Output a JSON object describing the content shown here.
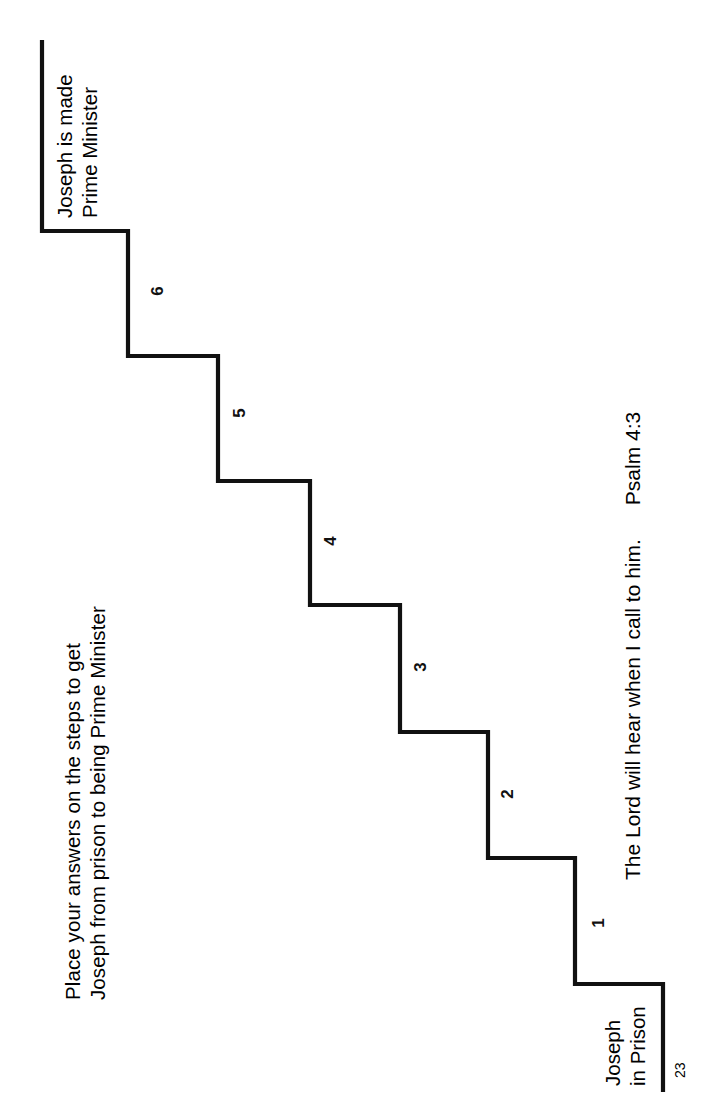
{
  "worksheet": {
    "page_number": "23",
    "instructions": {
      "line1": "Place your answers on the steps to get",
      "line2": "Joseph from prison to being Prime Minister"
    },
    "top_caption": {
      "line1": "Joseph is made",
      "line2": "Prime Minister"
    },
    "bottom_caption": {
      "line1": "Joseph",
      "line2": "in Prison"
    },
    "verse": {
      "text": "The Lord will hear when I call to him.",
      "reference": "Psalm 4:3"
    },
    "steps": [
      {
        "number": "1"
      },
      {
        "number": "2"
      },
      {
        "number": "3"
      },
      {
        "number": "4"
      },
      {
        "number": "5"
      },
      {
        "number": "6"
      }
    ],
    "colors": {
      "ink": "#111111",
      "paper": "#ffffff"
    }
  }
}
